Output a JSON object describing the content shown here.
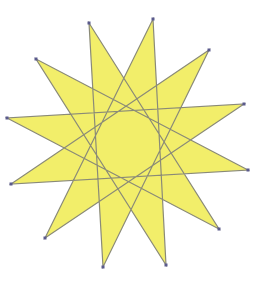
{
  "figure": {
    "type": "star-polygon",
    "schlafli": "{12/5}",
    "vertex_count": 12,
    "step": 5,
    "colors": {
      "fill": "#F2EE6A",
      "stroke": "#8A8A78",
      "vertex": "#5A5A8C",
      "background": "#FFFFFF"
    },
    "vertices": [
      [
        89,
        23
      ],
      [
        153,
        19
      ],
      [
        209,
        50
      ],
      [
        244,
        104
      ],
      [
        248,
        170
      ],
      [
        219,
        229
      ],
      [
        166,
        265
      ],
      [
        103,
        267
      ],
      [
        45,
        238
      ],
      [
        11,
        184
      ],
      [
        7,
        118
      ],
      [
        36,
        59
      ]
    ]
  }
}
